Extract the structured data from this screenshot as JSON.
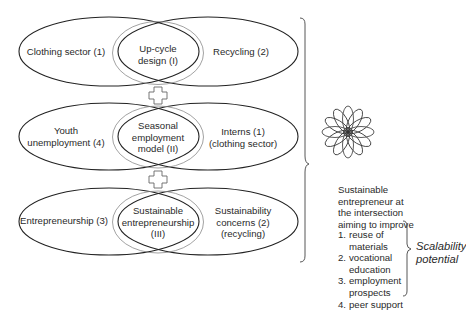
{
  "rows": [
    {
      "left_label": [
        "Clothing sector (1)"
      ],
      "center_label": [
        "Up-cycle",
        "design (I)"
      ],
      "right_label": [
        "Recycling (2)"
      ]
    },
    {
      "left_label": [
        "Youth",
        "unemployment (4)"
      ],
      "center_label": [
        "Seasonal",
        "employment",
        "model (II)"
      ],
      "right_label": [
        "Interns (1)",
        "(clothing sector)"
      ]
    },
    {
      "left_label": [
        "Entrepreneurship (3)"
      ],
      "center_label": [
        "Sustainable",
        "entrepreneurship",
        "(III)"
      ],
      "right_label": [
        "Sustainability",
        "concerns (2)",
        "(recycling)"
      ]
    }
  ],
  "connectors": [
    "plus-icon",
    "plus-icon"
  ],
  "outcome": {
    "icon": "flower-star-icon",
    "caption": [
      "Sustainable",
      "entrepreneur at",
      "the intersection",
      "aiming to improve"
    ],
    "list": [
      {
        "num": "1.",
        "lines": [
          "reuse of",
          "materials"
        ]
      },
      {
        "num": "2.",
        "lines": [
          "vocational",
          "education"
        ]
      },
      {
        "num": "3.",
        "lines": [
          "employment",
          "prospects"
        ]
      },
      {
        "num": "4.",
        "lines": [
          "peer support"
        ]
      }
    ],
    "scalability_label": [
      "Scalability",
      "potential"
    ]
  },
  "colors": {
    "outer_stroke": "#222222",
    "inner_stroke": "#8a8a8a",
    "text": "#2a2a2a"
  }
}
